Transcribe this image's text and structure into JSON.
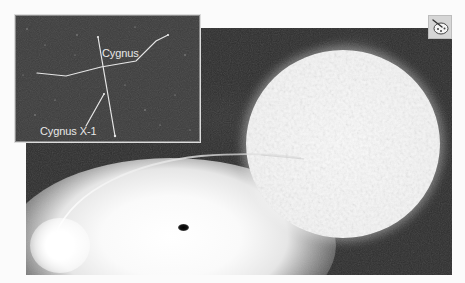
{
  "figure": {
    "palette": "grayscale",
    "colors": {
      "background": "#fbfbfb",
      "space": "#2e2e2e",
      "inset_background": "#3b3b3b",
      "star": "#f4f4f4",
      "line": "#e6e6e6",
      "black_hole": "#000000"
    }
  },
  "inset": {
    "constellation_label": "Cygnus",
    "target_label": "Cygnus X-1"
  },
  "main": {
    "elements": [
      "supergiant-star",
      "accretion-disk",
      "hot-spot",
      "black-hole",
      "gas-streamer"
    ]
  },
  "corner_icon": {
    "icon": "palette-icon"
  }
}
